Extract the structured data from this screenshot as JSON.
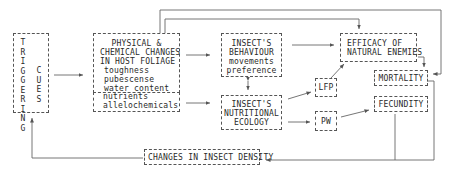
{
  "diagram": {
    "triggering_cues": {
      "word1": [
        "T",
        "R",
        "I",
        "G",
        "G",
        "E",
        "R",
        "I",
        "N",
        "G"
      ],
      "word2": [
        "C",
        "U",
        "E",
        "S"
      ]
    },
    "physical_chemical": {
      "title_lines": [
        "PHYSICAL &",
        "CHEMICAL CHANGES",
        "IN HOST FOLIAGE"
      ],
      "items": [
        "toughness",
        "pubescense",
        "water content",
        "nutrients",
        "allelochemicals"
      ]
    },
    "behaviour": {
      "title_lines": [
        "INSECT'S",
        "BEHAVIOUR"
      ],
      "items": [
        "movements",
        "preference"
      ]
    },
    "nutritional": {
      "title_lines": [
        "INSECT'S",
        "NUTRITIONAL",
        "ECOLOGY"
      ]
    },
    "efficacy": {
      "title_lines": [
        "EFFICACY OF",
        "NATURAL ENEMIES"
      ]
    },
    "lfp": {
      "label": "LFP"
    },
    "pw": {
      "label": "PW"
    },
    "mortality": {
      "label": "MORTALITY"
    },
    "fecundity": {
      "label": "FECUNDITY"
    },
    "density": {
      "label": "CHANGES IN INSECT DENSITY"
    }
  },
  "colors": {
    "line": "#555555",
    "text": "#2a2a2a",
    "background": "#ffffff"
  }
}
